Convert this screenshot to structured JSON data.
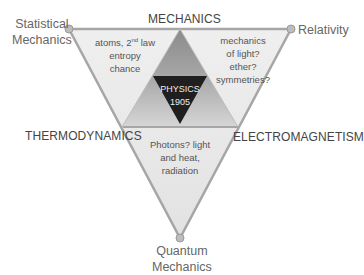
{
  "diagram": {
    "corners": {
      "top_left": "Statistical Mechanics",
      "top_left_lines": [
        "Statistical",
        "Mechanics"
      ],
      "top_right": "Relativity",
      "bottom": "Quantum Mechanics",
      "bottom_lines": [
        "Quantum",
        "Mechanics"
      ]
    },
    "edges": {
      "top": "MECHANICS",
      "left": "THERMODYNAMICS",
      "right": "ELECTROMAGNETISM"
    },
    "regions": {
      "left_top": {
        "line1_pre": "atoms, 2",
        "line1_sup": "nd",
        "line1_post": " law",
        "line2": "entropy",
        "line3": "chance"
      },
      "right_top": {
        "lines": [
          "mechanics",
          "of light?",
          "ether?",
          "symmetries?"
        ]
      },
      "bottom": {
        "lines": [
          "Photons?  light",
          "and heat,",
          "radiation"
        ]
      },
      "center": {
        "lines": [
          "PHYSICS",
          "1905"
        ]
      }
    },
    "colors": {
      "outer_fill": "#ececec",
      "outer_stroke": "#a6a6a6",
      "upper_triangle_dark": "#8c8c8c",
      "upper_triangle_light": "#c8c8c8",
      "center_fill": "#1f1f1f",
      "node_fill": "#bdbdbd"
    }
  }
}
